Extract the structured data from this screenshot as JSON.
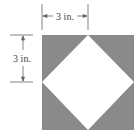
{
  "figure": {
    "top_dimension_label": "3 in.",
    "left_dimension_label": "3 in.",
    "colors": {
      "shaded": "#8a8a8a",
      "inner": "#ffffff",
      "lines": "#666666",
      "text": "#444444"
    }
  }
}
